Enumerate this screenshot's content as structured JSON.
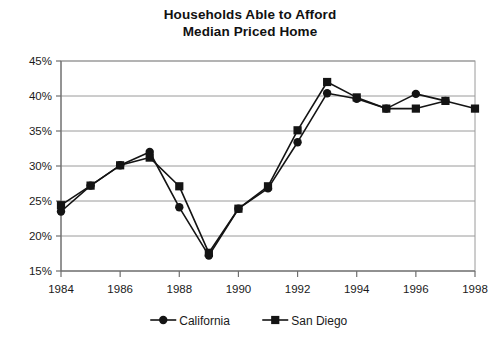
{
  "chart_data": {
    "type": "line",
    "title": "Households Able to Afford Median Priced Home",
    "title_lines": [
      "Households Able to Afford",
      "Median Priced Home"
    ],
    "xlabel": "",
    "ylabel": "",
    "x": [
      1984,
      1985,
      1986,
      1987,
      1988,
      1989,
      1990,
      1991,
      1992,
      1993,
      1994,
      1995,
      1996,
      1997,
      1998
    ],
    "xtick_labels": [
      "1984",
      "1986",
      "1988",
      "1990",
      "1992",
      "1994",
      "1996",
      "1998"
    ],
    "xtick_values": [
      1984,
      1986,
      1988,
      1990,
      1992,
      1994,
      1996,
      1998
    ],
    "xlim": [
      1984,
      1998
    ],
    "ytick_labels": [
      "15%",
      "20%",
      "25%",
      "30%",
      "35%",
      "40%",
      "45%"
    ],
    "ytick_values": [
      15,
      20,
      25,
      30,
      35,
      40,
      45
    ],
    "ylim": [
      15,
      45
    ],
    "grid": "horizontal",
    "legend_position": "bottom",
    "series": [
      {
        "name": "California",
        "marker": "circle",
        "color": "#141414",
        "values": [
          23.5,
          27.2,
          30.1,
          32.0,
          24.1,
          17.2,
          23.9,
          26.8,
          33.4,
          40.4,
          39.6,
          38.2,
          40.3,
          39.3,
          null
        ]
      },
      {
        "name": "San Diego",
        "marker": "square",
        "color": "#141414",
        "values": [
          24.4,
          27.2,
          30.1,
          31.2,
          27.1,
          17.6,
          23.9,
          27.1,
          35.1,
          42.0,
          39.8,
          38.2,
          38.2,
          39.3,
          38.2
        ]
      }
    ]
  },
  "legend": {
    "items": [
      {
        "label": "California",
        "marker": "circle"
      },
      {
        "label": "San Diego",
        "marker": "square"
      }
    ]
  },
  "colors": {
    "series": "#141414",
    "grid": "#9a9a9a",
    "axis": "#6e6e6e",
    "text": "#1a1a1a",
    "background": "#ffffff"
  }
}
